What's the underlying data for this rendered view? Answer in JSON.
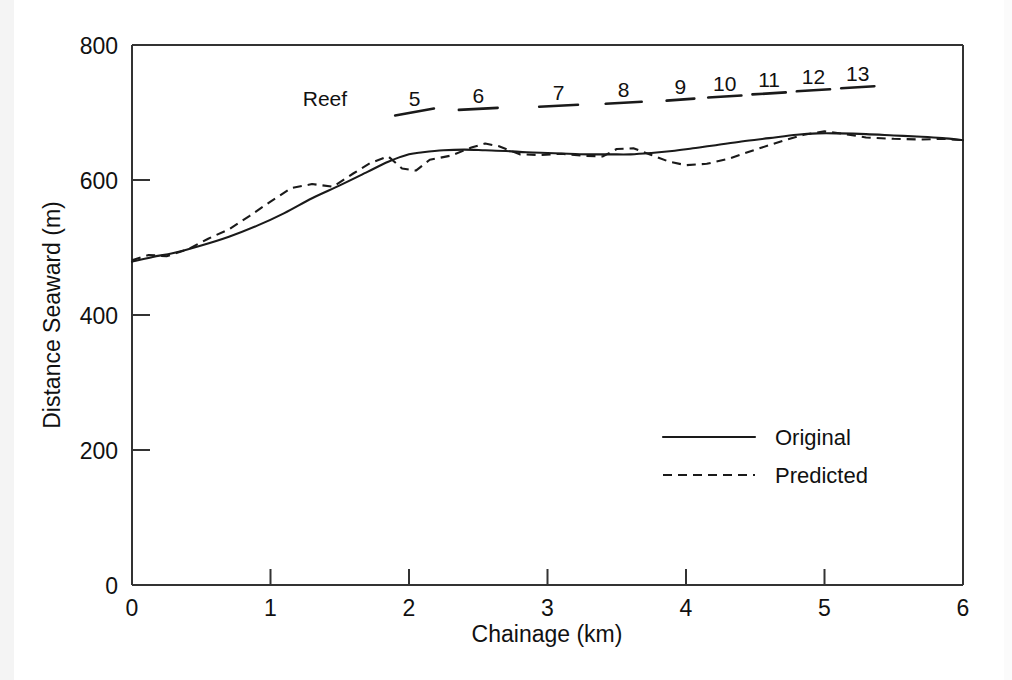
{
  "chart_data": {
    "type": "line",
    "title": "",
    "xlabel": "Chainage (km)",
    "ylabel": "Distance Seaward (m)",
    "xlim": [
      0,
      6
    ],
    "ylim": [
      0,
      800
    ],
    "xticks": [
      "0",
      "1",
      "2",
      "3",
      "4",
      "5",
      "6"
    ],
    "yticks": [
      "0",
      "200",
      "400",
      "600",
      "800"
    ],
    "grid": false,
    "legend_position": "inside-right-lower",
    "series": [
      {
        "name": "Original",
        "style": "solid",
        "x": [
          0.0,
          0.15,
          0.3,
          0.5,
          0.7,
          0.9,
          1.1,
          1.3,
          1.5,
          1.7,
          1.85,
          2.0,
          2.1,
          2.25,
          2.4,
          2.55,
          2.7,
          2.85,
          3.0,
          3.15,
          3.3,
          3.45,
          3.6,
          3.75,
          3.9,
          4.05,
          4.2,
          4.4,
          4.6,
          4.8,
          4.95,
          5.1,
          5.3,
          5.5,
          5.7,
          5.85,
          6.0
        ],
        "y": [
          479,
          486,
          492,
          503,
          516,
          532,
          551,
          573,
          592,
          612,
          627,
          638,
          641,
          644,
          645,
          644,
          643,
          641,
          640,
          639,
          638,
          638,
          638,
          640,
          643,
          647,
          651,
          657,
          662,
          667,
          669,
          669,
          668,
          666,
          664,
          662,
          659
        ]
      },
      {
        "name": "Predicted",
        "style": "dashed",
        "x": [
          0.0,
          0.12,
          0.25,
          0.4,
          0.55,
          0.7,
          0.85,
          1.0,
          1.15,
          1.3,
          1.45,
          1.6,
          1.72,
          1.85,
          1.95,
          2.05,
          2.15,
          2.3,
          2.45,
          2.55,
          2.65,
          2.8,
          2.95,
          3.1,
          3.25,
          3.4,
          3.5,
          3.62,
          3.75,
          3.88,
          4.0,
          4.15,
          4.3,
          4.5,
          4.7,
          4.85,
          5.0,
          5.15,
          5.3,
          5.5,
          5.7,
          5.85,
          6.0
        ],
        "y": [
          481,
          489,
          487,
          497,
          513,
          527,
          547,
          568,
          588,
          594,
          590,
          610,
          625,
          635,
          617,
          614,
          630,
          636,
          648,
          654,
          650,
          638,
          637,
          639,
          636,
          635,
          646,
          647,
          637,
          627,
          622,
          624,
          631,
          645,
          658,
          667,
          672,
          668,
          663,
          661,
          660,
          661,
          659
        ]
      }
    ],
    "reef_annotations": {
      "prefix_label": "Reef",
      "items": [
        {
          "label": "5",
          "x_start": 1.9,
          "x_end": 2.18
        },
        {
          "label": "6",
          "x_start": 2.36,
          "x_end": 2.64
        },
        {
          "label": "7",
          "x_start": 2.94,
          "x_end": 3.22
        },
        {
          "label": "8",
          "x_start": 3.42,
          "x_end": 3.68
        },
        {
          "label": "9",
          "x_start": 3.86,
          "x_end": 4.06
        },
        {
          "label": "10",
          "x_start": 4.16,
          "x_end": 4.4
        },
        {
          "label": "11",
          "x_start": 4.48,
          "x_end": 4.72
        },
        {
          "label": "12",
          "x_start": 4.8,
          "x_end": 5.04
        },
        {
          "label": "13",
          "x_start": 5.12,
          "x_end": 5.36
        }
      ]
    },
    "legend_entries": [
      {
        "label": "Original",
        "style": "solid"
      },
      {
        "label": "Predicted",
        "style": "dashed"
      }
    ]
  }
}
